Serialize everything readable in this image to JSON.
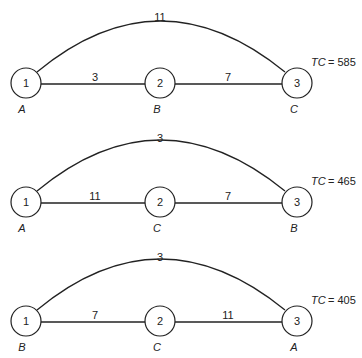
{
  "layouts": [
    {
      "nodes": [
        {
          "num": "1",
          "dept": "A"
        },
        {
          "num": "2",
          "dept": "B"
        },
        {
          "num": "3",
          "dept": "C"
        }
      ],
      "edges": {
        "n1_n2": "3",
        "n2_n3": "7",
        "n1_n3": "11"
      },
      "tc_label": "TC",
      "tc_value": "= 585"
    },
    {
      "nodes": [
        {
          "num": "1",
          "dept": "A"
        },
        {
          "num": "2",
          "dept": "C"
        },
        {
          "num": "3",
          "dept": "B"
        }
      ],
      "edges": {
        "n1_n2": "11",
        "n2_n3": "7",
        "n1_n3": "3"
      },
      "tc_label": "TC",
      "tc_value": "= 465"
    },
    {
      "nodes": [
        {
          "num": "1",
          "dept": "B"
        },
        {
          "num": "2",
          "dept": "C"
        },
        {
          "num": "3",
          "dept": "A"
        }
      ],
      "edges": {
        "n1_n2": "7",
        "n2_n3": "11",
        "n1_n3": "3"
      },
      "tc_label": "TC",
      "tc_value": "= 405"
    }
  ]
}
